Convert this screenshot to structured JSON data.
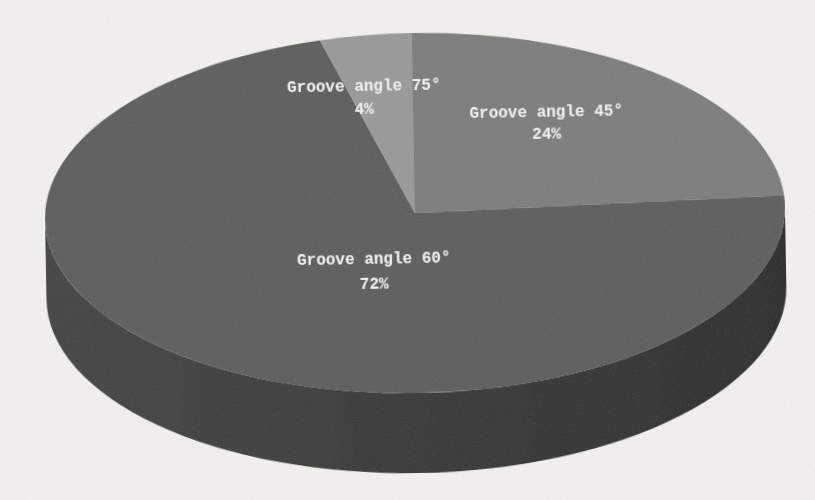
{
  "figure": {
    "background_color": "#f4f2ef",
    "appearance": "grayscale scanned 3D pie chart, no title, no legend"
  },
  "chart_data": {
    "type": "pie",
    "style": "3d",
    "direction": "clockwise",
    "start_angle_deg": 0,
    "legend": "none",
    "title": "",
    "categories": [
      "Groove angle 45°",
      "Groove angle 60°",
      "Groove angle 75°"
    ],
    "values": [
      24,
      72,
      4
    ],
    "slices": [
      {
        "label": "Groove angle 45°",
        "percent_label": "24%",
        "value": 24,
        "color": "#7b7b7b"
      },
      {
        "label": "Groove angle 60°",
        "percent_label": "72%",
        "value": 72,
        "color": "#5c5c5c"
      },
      {
        "label": "Groove angle 75°",
        "percent_label": "4%",
        "value": 4,
        "color": "#989898"
      }
    ],
    "label_text_color": "#f3f3f3",
    "rim_color_left": "#434343",
    "rim_color_right": "#2c2c2c"
  }
}
